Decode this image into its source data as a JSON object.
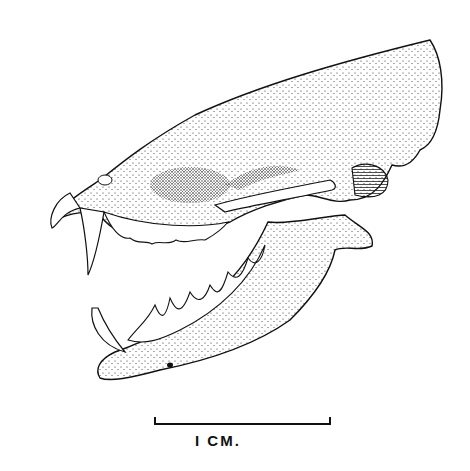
{
  "figure": {
    "scale_bar": {
      "label": "I CM."
    }
  }
}
